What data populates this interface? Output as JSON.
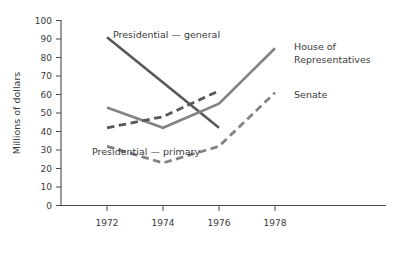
{
  "chart_data": {
    "type": "line",
    "title": "",
    "xlabel": "",
    "ylabel": "Millions of dollars",
    "x": [
      1972,
      1974,
      1976,
      1978
    ],
    "xtick_labels": [
      "1972",
      "1974",
      "1976",
      "1978"
    ],
    "ytick_labels": [
      "0",
      "10",
      "20",
      "30",
      "40",
      "50",
      "60",
      "70",
      "80",
      "90",
      "100"
    ],
    "ytick_values": [
      0,
      10,
      20,
      30,
      40,
      50,
      60,
      70,
      80,
      90,
      100
    ],
    "xlim": [
      1971.2,
      1979.6
    ],
    "ylim": [
      0,
      100
    ],
    "grid": false,
    "legend_position": "inline-annotations",
    "series": [
      {
        "name": "Presidential — general",
        "label": "Presidential — general",
        "style": "solid",
        "color": "#585858",
        "x": [
          1972,
          1976
        ],
        "values": [
          91,
          42
        ]
      },
      {
        "name": "House of Representatives",
        "label": "House of\nRepresentatives",
        "label_line1": "House of",
        "label_line2": "Representatives",
        "style": "solid",
        "color": "#838383",
        "x": [
          1972,
          1974,
          1976,
          1978
        ],
        "values": [
          53,
          42,
          55,
          85
        ]
      },
      {
        "name": "Presidential — primary",
        "label": "Presidential — primary",
        "style": "dashed",
        "color": "#585858",
        "x": [
          1972,
          1974,
          1976
        ],
        "values": [
          42,
          48,
          62
        ]
      },
      {
        "name": "Senate",
        "label": "Senate",
        "style": "dashed",
        "color": "#838383",
        "x": [
          1972,
          1974,
          1976,
          1978
        ],
        "values": [
          32,
          23,
          32,
          61
        ]
      }
    ]
  },
  "axis": {
    "y_title": "Millions of dollars"
  },
  "annotations": {
    "presidential_general": "Presidential — general",
    "presidential_primary": "Presidential — primary",
    "house_line1": "House of",
    "house_line2": "Representatives",
    "senate": "Senate"
  },
  "colors": {
    "dark_series": "#585858",
    "light_series": "#838383",
    "axis": "#4a4a4a",
    "text": "#3a3a3a",
    "background": "#ffffff"
  }
}
